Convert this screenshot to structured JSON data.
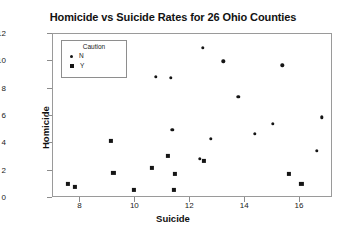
{
  "chart_data": {
    "type": "scatter",
    "title": "Homicide vs Suicide Rates for 26 Ohio Counties",
    "xlabel": "Suicide",
    "ylabel": "Homicide",
    "xlim": [
      7.0,
      17.2
    ],
    "ylim": [
      0,
      12
    ],
    "xticks": [
      8,
      10,
      12,
      14,
      16
    ],
    "yticks": [
      0,
      2,
      4,
      6,
      8,
      10,
      12
    ],
    "grid": false,
    "legend": {
      "title": "Caution",
      "position": "top-left-inside",
      "entries": [
        {
          "label": "N",
          "marker": "circle"
        },
        {
          "label": "Y",
          "marker": "square"
        }
      ]
    },
    "series": [
      {
        "name": "N",
        "marker": "circle",
        "points": [
          {
            "x": 9.55,
            "y": 9.2
          },
          {
            "x": 10.75,
            "y": 8.85
          },
          {
            "x": 11.3,
            "y": 8.8
          },
          {
            "x": 12.45,
            "y": 11.0
          },
          {
            "x": 13.2,
            "y": 10.0
          },
          {
            "x": 15.35,
            "y": 9.7
          },
          {
            "x": 13.75,
            "y": 7.4
          },
          {
            "x": 11.35,
            "y": 5.0
          },
          {
            "x": 14.35,
            "y": 4.7
          },
          {
            "x": 12.75,
            "y": 4.35
          },
          {
            "x": 16.8,
            "y": 5.9
          },
          {
            "x": 16.6,
            "y": 3.45
          },
          {
            "x": 15.0,
            "y": 5.45
          },
          {
            "x": 12.35,
            "y": 2.85
          }
        ]
      },
      {
        "name": "Y",
        "marker": "square",
        "points": [
          {
            "x": 7.55,
            "y": 1.05
          },
          {
            "x": 7.8,
            "y": 0.8
          },
          {
            "x": 9.1,
            "y": 4.15
          },
          {
            "x": 11.2,
            "y": 3.1
          },
          {
            "x": 10.6,
            "y": 2.2
          },
          {
            "x": 9.2,
            "y": 1.85
          },
          {
            "x": 11.45,
            "y": 1.75
          },
          {
            "x": 9.95,
            "y": 0.6
          },
          {
            "x": 11.4,
            "y": 0.6
          },
          {
            "x": 12.5,
            "y": 2.7
          },
          {
            "x": 15.6,
            "y": 1.75
          },
          {
            "x": 16.05,
            "y": 1.05
          }
        ]
      }
    ]
  }
}
